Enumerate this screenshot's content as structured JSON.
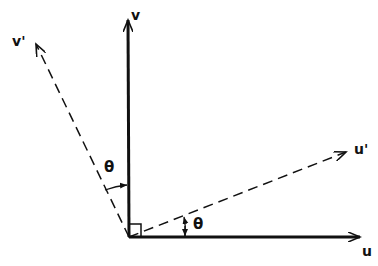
{
  "diagram": {
    "labels": {
      "v": "v",
      "v_prime": "v'",
      "u": "u",
      "u_prime": "u'",
      "theta_upper": "θ",
      "theta_lower": "θ"
    },
    "vectors": [
      {
        "name": "v",
        "style": "solid",
        "from": [
          129,
          237
        ],
        "to": [
          128,
          18
        ]
      },
      {
        "name": "u",
        "style": "solid",
        "from": [
          129,
          237
        ],
        "to": [
          362,
          237
        ]
      },
      {
        "name": "v'",
        "style": "dashed",
        "from": [
          129,
          237
        ],
        "to": [
          35,
          42
        ]
      },
      {
        "name": "u'",
        "style": "dashed",
        "from": [
          129,
          237
        ],
        "to": [
          348,
          151
        ]
      }
    ],
    "color": "#111111"
  }
}
